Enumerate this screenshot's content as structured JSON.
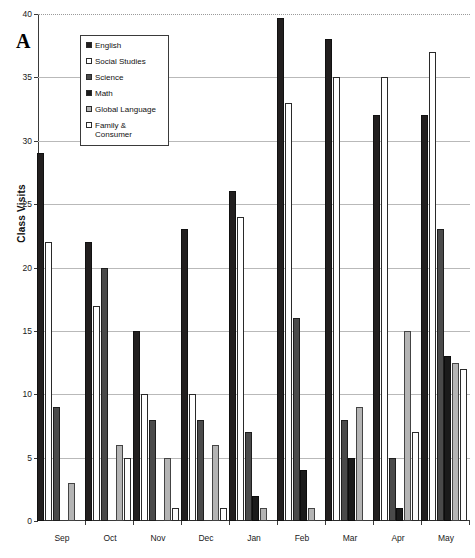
{
  "panel_letter": "A",
  "axes": {
    "ylabel": "Class Visits",
    "yticks": [
      "0",
      "5",
      "10",
      "15",
      "20",
      "25",
      "30",
      "35",
      "40"
    ],
    "ymin": 0,
    "ymax": 40
  },
  "legend": {
    "items": [
      {
        "label": "English",
        "color": "#221f1f",
        "swatch": "solid-black"
      },
      {
        "label": "Social Studies",
        "color": "#ffffff",
        "swatch": "open-white"
      },
      {
        "label": "Science",
        "color": "#4a4a4a",
        "swatch": "solid-darkgray"
      },
      {
        "label": "Math",
        "color": "#1b1b1b",
        "swatch": "solid-black"
      },
      {
        "label": "Global Language",
        "color": "#b4b4b4",
        "swatch": "solid-lightgray"
      },
      {
        "label": "Family &\nConsumer",
        "color": "#fdfdfd",
        "swatch": "open-white"
      }
    ]
  },
  "chart_data": {
    "type": "bar",
    "title": "",
    "xlabel": "",
    "ylabel": "Class Visits",
    "ylim": [
      0,
      40
    ],
    "yticks": [
      0,
      5,
      10,
      15,
      20,
      25,
      30,
      35,
      40
    ],
    "grid": true,
    "legend_position": "inside-top-left",
    "categories": [
      "Sep",
      "Oct",
      "Nov",
      "Dec",
      "Jan",
      "Feb",
      "Mar",
      "Apr",
      "May"
    ],
    "series": [
      {
        "name": "English",
        "color": "#221f1f",
        "values": [
          29,
          22,
          15,
          23,
          26,
          39.7,
          38,
          32,
          32
        ]
      },
      {
        "name": "Social Studies",
        "color": "#ffffff",
        "values": [
          22,
          17,
          10,
          10,
          24,
          33,
          35,
          35,
          37
        ]
      },
      {
        "name": "Science",
        "color": "#4a4a4a",
        "values": [
          9,
          20,
          8,
          8,
          7,
          16,
          8,
          5,
          23
        ]
      },
      {
        "name": "Math",
        "color": "#1b1b1b",
        "values": [
          0,
          0,
          0,
          0,
          2,
          4,
          5,
          1,
          13
        ]
      },
      {
        "name": "Global Language",
        "color": "#b4b4b4",
        "values": [
          3,
          6,
          5,
          6,
          1,
          1,
          9,
          15,
          12.5
        ]
      },
      {
        "name": "Family & Consumer",
        "color": "#fdfdfd",
        "values": [
          0,
          5,
          1,
          1,
          0,
          0,
          0,
          7,
          12
        ]
      }
    ]
  }
}
